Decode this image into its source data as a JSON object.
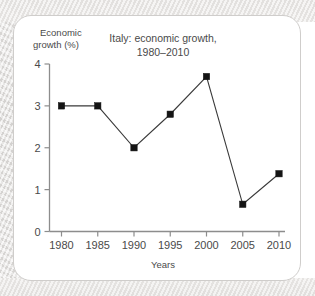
{
  "chart_data": {
    "type": "line",
    "title": "Italy: economic growth, 1980–2010",
    "title_line1": "Italy: economic growth,",
    "title_line2": "1980–2010",
    "ylabel": "Economic growth (%)",
    "ylabel_line1": "Economic",
    "ylabel_line2": "growth (%)",
    "xlabel": "Years",
    "categories": [
      "1980",
      "1985",
      "1990",
      "1995",
      "2000",
      "2005",
      "2010"
    ],
    "x": [
      1980,
      1985,
      1990,
      1995,
      2000,
      2005,
      2010
    ],
    "values": [
      3.0,
      3.0,
      2.0,
      2.8,
      3.7,
      0.65,
      1.38
    ],
    "series": [
      {
        "name": "Economic growth (%)",
        "values": [
          3.0,
          3.0,
          2.0,
          2.8,
          3.7,
          0.65,
          1.38
        ]
      }
    ],
    "ylim": [
      0,
      4
    ],
    "yticks": [
      0,
      1,
      2,
      3,
      4
    ],
    "ytick_labels": [
      "0",
      "1",
      "2",
      "3",
      "4"
    ],
    "xlim": [
      1980,
      2010
    ],
    "xticks": [
      1980,
      1985,
      1990,
      1995,
      2000,
      2005,
      2010
    ],
    "grid": false,
    "legend": "none",
    "marker": "square",
    "colors": {
      "line": "#3a3a3a",
      "marker": "#141414",
      "axis": "#8d8d8d",
      "text": "#4a4a4a",
      "card_background": "#ffffff",
      "card_border": "#cfcdcb",
      "page_background": "#e7e5e3"
    }
  }
}
